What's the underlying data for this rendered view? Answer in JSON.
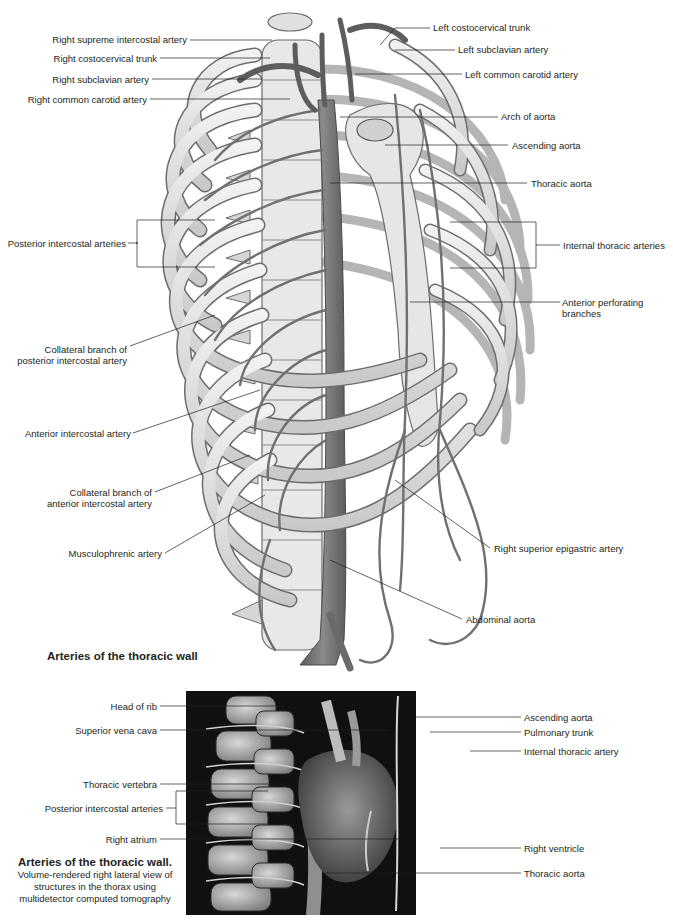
{
  "figure1": {
    "title": "Arteries of the thoracic wall",
    "labels_left": {
      "right_supreme_intercostal": "Right supreme intercostal artery",
      "right_costocervical": "Right costocervical trunk",
      "right_subclavian": "Right subclavian artery",
      "right_common_carotid": "Right common carotid artery",
      "posterior_intercostal": "Posterior intercostal arteries",
      "collateral_posterior": "Collateral branch of posterior intercostal artery",
      "anterior_intercostal": "Anterior intercostal artery",
      "collateral_anterior": "Collateral branch of anterior intercostal artery",
      "musculophrenic": "Musculophrenic artery"
    },
    "labels_right": {
      "left_costocervical": "Left costocervical trunk",
      "left_subclavian": "Left subclavian artery",
      "left_common_carotid": "Left common carotid artery",
      "arch_of_aorta": "Arch of aorta",
      "ascending_aorta": "Ascending aorta",
      "thoracic_aorta": "Thoracic aorta",
      "internal_thoracic": "Internal thoracic arteries",
      "anterior_perforating": "Anterior perforating branches",
      "right_superior_epigastric": "Right superior epigastric artery",
      "abdominal_aorta": "Abdominal aorta"
    }
  },
  "figure2": {
    "caption_title": "Arteries of the thoracic wall.",
    "caption_body": "Volume-rendered right lateral view of structures in the thorax using multidetector computed tomography",
    "labels_left": {
      "head_of_rib": "Head of rib",
      "superior_vena_cava": "Superior vena cava",
      "thoracic_vertebra": "Thoracic vertebra",
      "posterior_intercostal": "Posterior intercostal arteries",
      "right_atrium": "Right atrium"
    },
    "labels_right": {
      "ascending_aorta": "Ascending aorta",
      "pulmonary_trunk": "Pulmonary trunk",
      "internal_thoracic": "Internal thoracic artery",
      "right_ventricle": "Right ventricle",
      "thoracic_aorta": "Thoracic aorta"
    }
  },
  "colors": {
    "bone": "#e4e4e4",
    "bone_outline": "#6d6d6d",
    "artery": "#7a7a7a",
    "leader_line": "#231f20",
    "ct_background": "#0d0d0d"
  }
}
